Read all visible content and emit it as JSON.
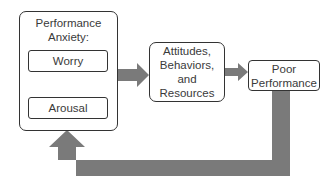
{
  "diagram": {
    "anxiety_group": {
      "title_line1": "Performance",
      "title_line2": "Anxiety:",
      "worry_label": "Worry",
      "arousal_label": "Arousal"
    },
    "middle_box": {
      "line1": "Attitudes,",
      "line2": "Behaviors,",
      "line3": "and",
      "line4": "Resources"
    },
    "outcome_box": {
      "line1": "Poor",
      "line2": "Performance"
    },
    "colors": {
      "arrow_fill": "#7a7a7a",
      "border": "#333333",
      "text": "#3a3a3a"
    },
    "connections": [
      {
        "from": "Performance Anxiety",
        "to": "Attitudes, Behaviors, and Resources"
      },
      {
        "from": "Attitudes, Behaviors, and Resources",
        "to": "Poor Performance"
      },
      {
        "from": "Poor Performance",
        "to": "Performance Anxiety",
        "type": "feedback"
      },
      {
        "from": "Worry",
        "to": "Arousal",
        "type": "bidirectional"
      }
    ]
  }
}
